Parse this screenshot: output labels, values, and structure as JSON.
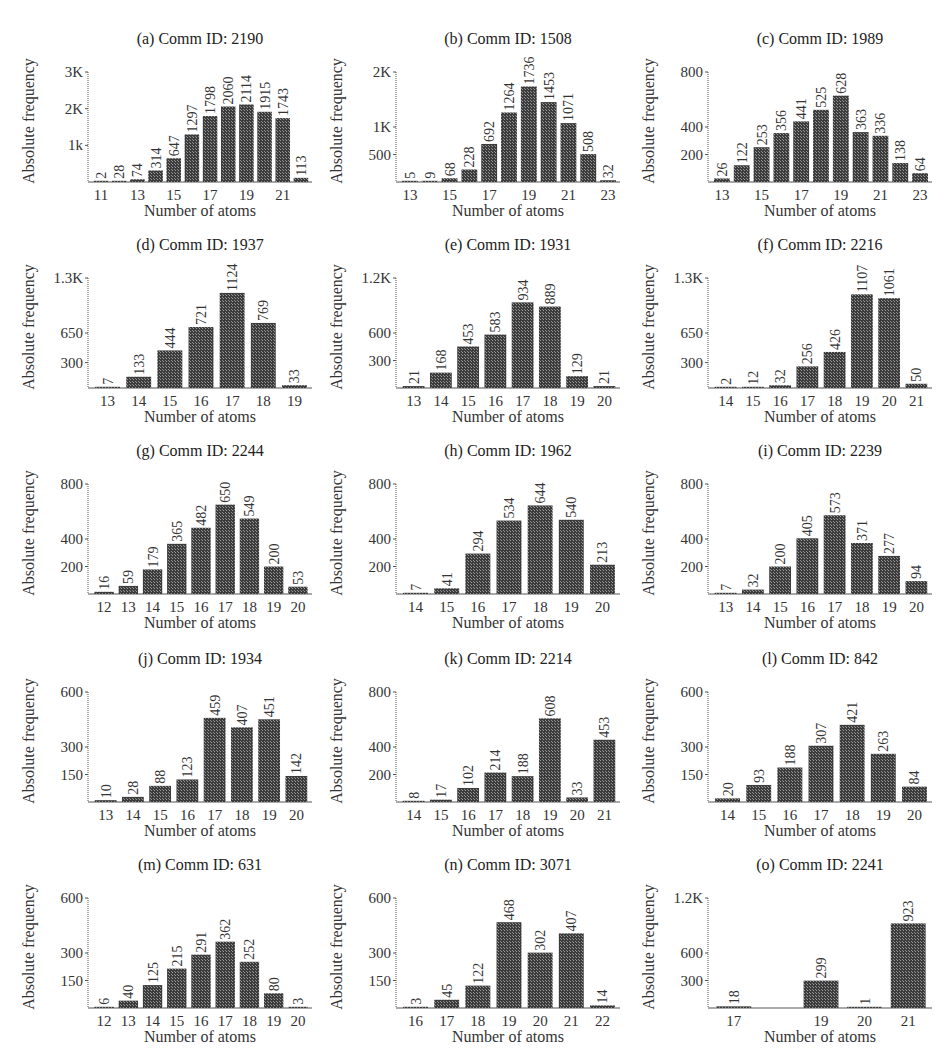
{
  "figure": {
    "xlabel": "Number of atoms",
    "ylabel": "Absolute frequency",
    "bar_color": "#3c3c3c",
    "axis_color": "#555555"
  },
  "chart_data": [
    {
      "type": "bar",
      "title": "(a) Comm ID: 2190",
      "xlabel": "Number of atoms",
      "ylabel": "Absolute frequency",
      "categories": [
        11,
        12,
        13,
        14,
        15,
        16,
        17,
        18,
        19,
        20,
        21,
        22
      ],
      "values": [
        2,
        28,
        74,
        314,
        647,
        1297,
        1798,
        2060,
        2114,
        1915,
        1743,
        113
      ],
      "xticks": [
        "11",
        "13",
        "15",
        "17",
        "19",
        "21"
      ],
      "xtick_positions": [
        11,
        13,
        15,
        17,
        19,
        21
      ],
      "yticks": [
        {
          "v": 1000,
          "label": "1k"
        },
        {
          "v": 2000,
          "label": "2K"
        },
        {
          "v": 3000,
          "label": "3K"
        }
      ],
      "ylim": [
        0,
        3000
      ]
    },
    {
      "type": "bar",
      "title": "(b) Comm ID: 1508",
      "xlabel": "Number of atoms",
      "ylabel": "Absolute frequency",
      "categories": [
        13,
        14,
        15,
        16,
        17,
        18,
        19,
        20,
        21,
        22,
        23
      ],
      "values": [
        5,
        9,
        68,
        228,
        692,
        1264,
        1736,
        1453,
        1071,
        508,
        32
      ],
      "xticks": [
        "13",
        "15",
        "17",
        "19",
        "21",
        "23"
      ],
      "xtick_positions": [
        13,
        15,
        17,
        19,
        21,
        23
      ],
      "yticks": [
        {
          "v": 500,
          "label": "500"
        },
        {
          "v": 1000,
          "label": "1K"
        },
        {
          "v": 2000,
          "label": "2K"
        }
      ],
      "ylim": [
        0,
        2000
      ]
    },
    {
      "type": "bar",
      "title": "(c) Comm ID: 1989",
      "xlabel": "Number of atoms",
      "ylabel": "Absolute frequency",
      "categories": [
        13,
        14,
        15,
        16,
        17,
        18,
        19,
        20,
        21,
        22,
        23
      ],
      "values": [
        26,
        122,
        253,
        356,
        441,
        525,
        628,
        363,
        336,
        138,
        64
      ],
      "xticks": [
        "13",
        "15",
        "17",
        "19",
        "21",
        "23"
      ],
      "xtick_positions": [
        13,
        15,
        17,
        19,
        21,
        23
      ],
      "yticks": [
        {
          "v": 200,
          "label": "200"
        },
        {
          "v": 400,
          "label": "400"
        },
        {
          "v": 800,
          "label": "800"
        }
      ],
      "ylim": [
        0,
        800
      ]
    },
    {
      "type": "bar",
      "title": "(d) Comm ID: 1937",
      "xlabel": "Number of atoms",
      "ylabel": "Absolute frequency",
      "categories": [
        13,
        14,
        15,
        16,
        17,
        18,
        19
      ],
      "values": [
        7,
        133,
        444,
        721,
        1124,
        769,
        33
      ],
      "xticks": [
        "13",
        "14",
        "15",
        "16",
        "17",
        "18",
        "19"
      ],
      "xtick_positions": [
        13,
        14,
        15,
        16,
        17,
        18,
        19
      ],
      "yticks": [
        {
          "v": 300,
          "label": "300"
        },
        {
          "v": 650,
          "label": "650"
        },
        {
          "v": 1300,
          "label": "1.3K"
        }
      ],
      "ylim": [
        0,
        1300
      ]
    },
    {
      "type": "bar",
      "title": "(e) Comm ID: 1931",
      "xlabel": "Number of atoms",
      "ylabel": "Absolute frequency",
      "categories": [
        13,
        14,
        15,
        16,
        17,
        18,
        19,
        20
      ],
      "values": [
        21,
        168,
        453,
        583,
        934,
        889,
        129,
        21
      ],
      "xticks": [
        "13",
        "14",
        "15",
        "16",
        "17",
        "18",
        "19",
        "20"
      ],
      "xtick_positions": [
        13,
        14,
        15,
        16,
        17,
        18,
        19,
        20
      ],
      "yticks": [
        {
          "v": 300,
          "label": "300"
        },
        {
          "v": 600,
          "label": "600"
        },
        {
          "v": 1200,
          "label": "1.2K"
        }
      ],
      "ylim": [
        0,
        1200
      ]
    },
    {
      "type": "bar",
      "title": "(f) Comm ID: 2216",
      "xlabel": "Number of atoms",
      "ylabel": "Absolute frequency",
      "categories": [
        14,
        15,
        16,
        17,
        18,
        19,
        20,
        21
      ],
      "values": [
        2,
        12,
        32,
        256,
        426,
        1107,
        1061,
        50
      ],
      "xticks": [
        "14",
        "15",
        "16",
        "17",
        "18",
        "19",
        "20",
        "21"
      ],
      "xtick_positions": [
        14,
        15,
        16,
        17,
        18,
        19,
        20,
        21
      ],
      "yticks": [
        {
          "v": 300,
          "label": "300"
        },
        {
          "v": 650,
          "label": "650"
        },
        {
          "v": 1300,
          "label": "1.3K"
        }
      ],
      "ylim": [
        0,
        1300
      ]
    },
    {
      "type": "bar",
      "title": "(g) Comm ID: 2244",
      "xlabel": "Number of atoms",
      "ylabel": "Absolute frequency",
      "categories": [
        12,
        13,
        14,
        15,
        16,
        17,
        18,
        19,
        20
      ],
      "values": [
        16,
        59,
        179,
        365,
        482,
        650,
        549,
        200,
        53
      ],
      "xticks": [
        "12",
        "13",
        "14",
        "15",
        "16",
        "17",
        "18",
        "19",
        "20"
      ],
      "xtick_positions": [
        12,
        13,
        14,
        15,
        16,
        17,
        18,
        19,
        20
      ],
      "yticks": [
        {
          "v": 200,
          "label": "200"
        },
        {
          "v": 400,
          "label": "400"
        },
        {
          "v": 800,
          "label": "800"
        }
      ],
      "ylim": [
        0,
        800
      ]
    },
    {
      "type": "bar",
      "title": "(h) Comm ID: 1962",
      "xlabel": "Number of atoms",
      "ylabel": "Absolute frequency",
      "categories": [
        14,
        15,
        16,
        17,
        18,
        19,
        20
      ],
      "values": [
        7,
        41,
        294,
        534,
        644,
        540,
        213
      ],
      "xticks": [
        "14",
        "15",
        "16",
        "17",
        "18",
        "19",
        "20"
      ],
      "xtick_positions": [
        14,
        15,
        16,
        17,
        18,
        19,
        20
      ],
      "yticks": [
        {
          "v": 200,
          "label": "200"
        },
        {
          "v": 400,
          "label": "400"
        },
        {
          "v": 800,
          "label": "800"
        }
      ],
      "ylim": [
        0,
        800
      ]
    },
    {
      "type": "bar",
      "title": "(i) Comm ID: 2239",
      "xlabel": "Number of atoms",
      "ylabel": "Absolute frequency",
      "categories": [
        13,
        14,
        15,
        16,
        17,
        18,
        19,
        20
      ],
      "values": [
        7,
        32,
        200,
        405,
        573,
        371,
        277,
        94
      ],
      "xticks": [
        "13",
        "14",
        "15",
        "16",
        "17",
        "18",
        "19",
        "20"
      ],
      "xtick_positions": [
        13,
        14,
        15,
        16,
        17,
        18,
        19,
        20
      ],
      "yticks": [
        {
          "v": 200,
          "label": "200"
        },
        {
          "v": 400,
          "label": "400"
        },
        {
          "v": 800,
          "label": "800"
        }
      ],
      "ylim": [
        0,
        800
      ]
    },
    {
      "type": "bar",
      "title": "(j) Comm ID: 1934",
      "xlabel": "Number of atoms",
      "ylabel": "Absolute frequency",
      "categories": [
        13,
        14,
        15,
        16,
        17,
        18,
        19,
        20
      ],
      "values": [
        10,
        28,
        88,
        123,
        459,
        407,
        451,
        142
      ],
      "xticks": [
        "13",
        "14",
        "15",
        "16",
        "17",
        "18",
        "19",
        "20"
      ],
      "xtick_positions": [
        13,
        14,
        15,
        16,
        17,
        18,
        19,
        20
      ],
      "yticks": [
        {
          "v": 150,
          "label": "150"
        },
        {
          "v": 300,
          "label": "300"
        },
        {
          "v": 600,
          "label": "600"
        }
      ],
      "ylim": [
        0,
        600
      ]
    },
    {
      "type": "bar",
      "title": "(k) Comm ID: 2214",
      "xlabel": "Number of atoms",
      "ylabel": "Absolute frequency",
      "categories": [
        14,
        15,
        16,
        17,
        18,
        19,
        20,
        21
      ],
      "values": [
        8,
        17,
        102,
        214,
        188,
        608,
        33,
        453
      ],
      "xticks": [
        "14",
        "15",
        "16",
        "17",
        "18",
        "19",
        "20",
        "21"
      ],
      "xtick_positions": [
        14,
        15,
        16,
        17,
        18,
        19,
        20,
        21
      ],
      "yticks": [
        {
          "v": 200,
          "label": "200"
        },
        {
          "v": 400,
          "label": "400"
        },
        {
          "v": 800,
          "label": "800"
        }
      ],
      "ylim": [
        0,
        800
      ]
    },
    {
      "type": "bar",
      "title": "(l) Comm ID: 842",
      "xlabel": "Number of atoms",
      "ylabel": "Absolute frequency",
      "categories": [
        14,
        15,
        16,
        17,
        18,
        19,
        20
      ],
      "values": [
        20,
        93,
        188,
        307,
        421,
        263,
        84
      ],
      "xticks": [
        "14",
        "15",
        "16",
        "17",
        "18",
        "19",
        "20"
      ],
      "xtick_positions": [
        14,
        15,
        16,
        17,
        18,
        19,
        20
      ],
      "yticks": [
        {
          "v": 150,
          "label": "150"
        },
        {
          "v": 300,
          "label": "300"
        },
        {
          "v": 600,
          "label": "600"
        }
      ],
      "ylim": [
        0,
        600
      ]
    },
    {
      "type": "bar",
      "title": "(m) Comm ID: 631",
      "xlabel": "Number of atoms",
      "ylabel": "Absolute frequency",
      "categories": [
        12,
        13,
        14,
        15,
        16,
        17,
        18,
        19,
        20
      ],
      "values": [
        6,
        40,
        125,
        215,
        291,
        362,
        252,
        80,
        3
      ],
      "xticks": [
        "12",
        "13",
        "14",
        "15",
        "16",
        "17",
        "18",
        "19",
        "20"
      ],
      "xtick_positions": [
        12,
        13,
        14,
        15,
        16,
        17,
        18,
        19,
        20
      ],
      "yticks": [
        {
          "v": 150,
          "label": "150"
        },
        {
          "v": 300,
          "label": "300"
        },
        {
          "v": 600,
          "label": "600"
        }
      ],
      "ylim": [
        0,
        600
      ]
    },
    {
      "type": "bar",
      "title": "(n) Comm ID: 3071",
      "xlabel": "Number of atoms",
      "ylabel": "Absolute frequency",
      "categories": [
        16,
        17,
        18,
        19,
        20,
        21,
        22
      ],
      "values": [
        3,
        45,
        122,
        468,
        302,
        407,
        14
      ],
      "xticks": [
        "16",
        "17",
        "18",
        "19",
        "20",
        "21",
        "22"
      ],
      "xtick_positions": [
        16,
        17,
        18,
        19,
        20,
        21,
        22
      ],
      "yticks": [
        {
          "v": 150,
          "label": "150"
        },
        {
          "v": 300,
          "label": "300"
        },
        {
          "v": 600,
          "label": "600"
        }
      ],
      "ylim": [
        0,
        600
      ]
    },
    {
      "type": "bar",
      "title": "(o) Comm ID: 2241",
      "xlabel": "Number of atoms",
      "ylabel": "Absolute frequency",
      "categories": [
        17,
        18,
        19,
        20,
        21
      ],
      "values": [
        18,
        null,
        299,
        1,
        923
      ],
      "xticks": [
        "17",
        "19",
        "20",
        "21"
      ],
      "xtick_positions": [
        17,
        19,
        20,
        21
      ],
      "yticks": [
        {
          "v": 300,
          "label": "300"
        },
        {
          "v": 600,
          "label": "600"
        },
        {
          "v": 1200,
          "label": "1.2K"
        }
      ],
      "ylim": [
        0,
        1200
      ]
    }
  ]
}
